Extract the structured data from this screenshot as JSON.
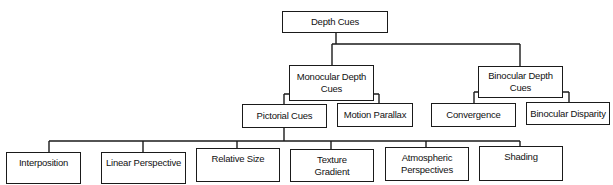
{
  "diagram": {
    "type": "tree",
    "root": {
      "id": "depth-cues",
      "label": "Depth Cues",
      "children": [
        "monocular",
        "binocular"
      ]
    },
    "nodes": {
      "depth-cues": "Depth Cues",
      "monocular": "Monocular Depth Cues",
      "binocular": "Binocular Depth Cues",
      "pictorial": "Pictorial Cues",
      "motion-parallax": "Motion Parallax",
      "convergence": "Convergence",
      "binocular-disparity": "Binocular Disparity",
      "interposition": "Interposition",
      "linear-perspective": "Linear Perspective",
      "relative-size": "Relative Size",
      "texture-gradient": "Texture Gradient",
      "atmospheric-perspectives": "Atmospheric Perspectives",
      "shading": "Shading"
    },
    "edges": [
      [
        "depth-cues",
        "monocular"
      ],
      [
        "depth-cues",
        "binocular"
      ],
      [
        "monocular",
        "pictorial"
      ],
      [
        "monocular",
        "motion-parallax"
      ],
      [
        "binocular",
        "convergence"
      ],
      [
        "binocular",
        "binocular-disparity"
      ],
      [
        "pictorial",
        "interposition"
      ],
      [
        "pictorial",
        "linear-perspective"
      ],
      [
        "pictorial",
        "relative-size"
      ],
      [
        "pictorial",
        "texture-gradient"
      ],
      [
        "pictorial",
        "atmospheric-perspectives"
      ],
      [
        "pictorial",
        "shading"
      ]
    ]
  }
}
